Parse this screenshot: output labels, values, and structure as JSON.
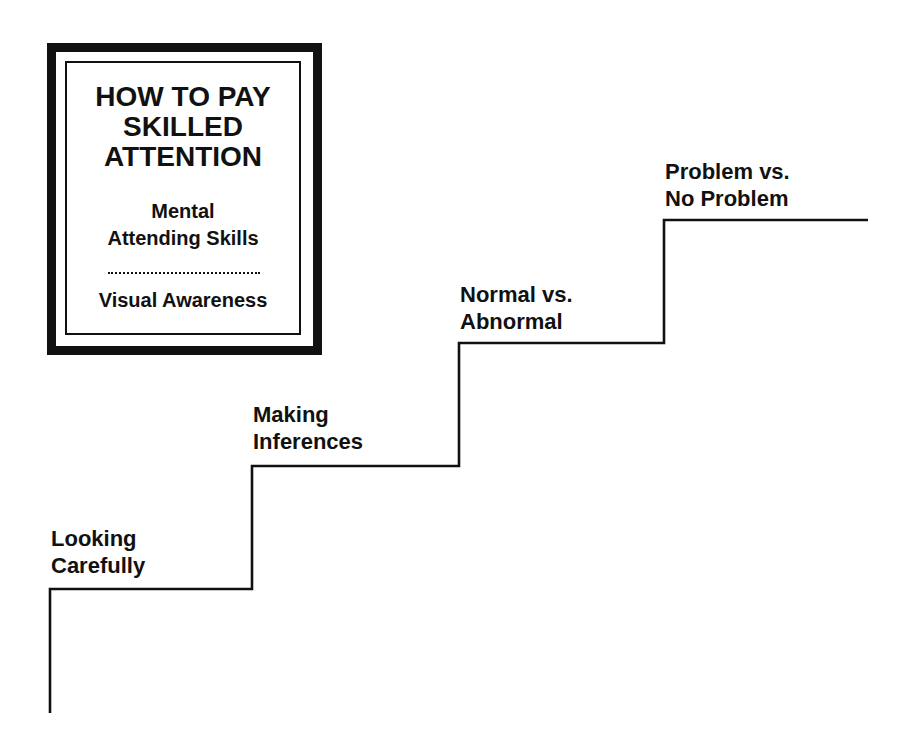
{
  "title_box": {
    "title_lines": [
      "HOW TO PAY",
      "SKILLED",
      "ATTENTION"
    ],
    "subtitle_lines": [
      "Mental",
      "Attending Skills"
    ],
    "divider": "dotted",
    "footer": "Visual Awareness"
  },
  "staircase": {
    "direction": "ascending left-to-right",
    "steps": [
      {
        "level": 1,
        "lines": [
          "Looking",
          "Carefully"
        ]
      },
      {
        "level": 2,
        "lines": [
          "Making",
          "Inferences"
        ]
      },
      {
        "level": 3,
        "lines": [
          "Normal vs.",
          "Abnormal"
        ]
      },
      {
        "level": 4,
        "lines": [
          "Problem vs.",
          "No Problem"
        ]
      }
    ]
  },
  "colors": {
    "ink": "#111111",
    "background": "#ffffff"
  }
}
